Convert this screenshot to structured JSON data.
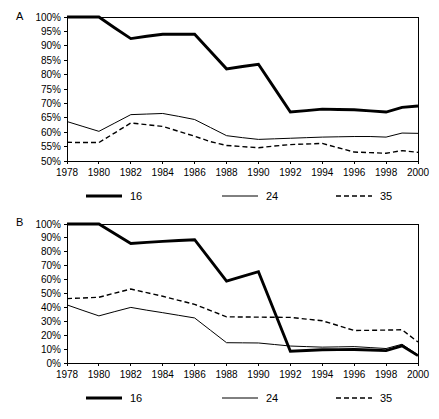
{
  "figure": {
    "background": "#ffffff",
    "line_color": "#000000",
    "panels": [
      {
        "label": "A"
      },
      {
        "label": "B"
      }
    ]
  },
  "chart_data": [
    {
      "type": "line",
      "panel": "A",
      "title": "",
      "xlabel": "",
      "ylabel": "",
      "x": [
        1978,
        1979,
        1980,
        1981,
        1982,
        1983,
        1984,
        1985,
        1986,
        1987,
        1988,
        1989,
        1990,
        1991,
        1992,
        1993,
        1994,
        1995,
        1996,
        1997,
        1998,
        1999,
        2000
      ],
      "xlim": [
        1978,
        2000
      ],
      "ylim": [
        50,
        100
      ],
      "ytick_labels": [
        "100%",
        "95%",
        "90%",
        "85%",
        "80%",
        "75%",
        "70%",
        "65%",
        "60%",
        "55%",
        "50%"
      ],
      "ytick_values": [
        100,
        95,
        90,
        85,
        80,
        75,
        70,
        65,
        60,
        55,
        50
      ],
      "xtick_labels": [
        "1978",
        "1980",
        "1982",
        "1984",
        "1986",
        "1988",
        "1990",
        "1992",
        "1994",
        "1996",
        "1998",
        "2000"
      ],
      "xtick_values": [
        1978,
        1980,
        1982,
        1984,
        1986,
        1988,
        1990,
        1992,
        1994,
        1996,
        1998,
        2000
      ],
      "grid": false,
      "legend_position": "bottom",
      "series": [
        {
          "name": "16",
          "style": "thick-solid",
          "values": [
            100.0,
            100.0,
            100.0,
            96.2,
            92.5,
            93.3,
            94.0,
            94.0,
            94.0,
            88.0,
            82.0,
            82.8,
            83.6,
            75.3,
            67.0,
            67.5,
            68.0,
            67.9,
            67.8,
            67.4,
            67.0,
            68.6,
            69.1
          ]
        },
        {
          "name": "24",
          "style": "thin-solid",
          "values": [
            63.7,
            62.0,
            60.3,
            63.2,
            66.1,
            66.3,
            66.5,
            65.5,
            64.4,
            61.6,
            58.8,
            58.1,
            57.5,
            57.7,
            57.9,
            58.1,
            58.3,
            58.4,
            58.5,
            58.5,
            58.3,
            59.7,
            59.6
          ]
        },
        {
          "name": "35",
          "style": "dashed",
          "values": [
            56.5,
            56.4,
            56.4,
            59.8,
            63.2,
            62.6,
            62.0,
            60.3,
            58.6,
            56.7,
            55.4,
            55.0,
            54.6,
            55.2,
            55.7,
            55.9,
            56.1,
            54.6,
            53.1,
            52.9,
            52.7,
            53.6,
            53.0
          ]
        }
      ],
      "legend": [
        {
          "label": "16",
          "style": "thick-solid"
        },
        {
          "label": "24",
          "style": "thin-solid"
        },
        {
          "label": "35",
          "style": "dashed"
        }
      ]
    },
    {
      "type": "line",
      "panel": "B",
      "title": "",
      "xlabel": "",
      "ylabel": "",
      "x": [
        1978,
        1979,
        1980,
        1981,
        1982,
        1983,
        1984,
        1985,
        1986,
        1987,
        1988,
        1989,
        1990,
        1991,
        1992,
        1993,
        1994,
        1995,
        1996,
        1997,
        1998,
        1999,
        2000
      ],
      "xlim": [
        1978,
        2000
      ],
      "ylim": [
        0,
        100
      ],
      "ytick_labels": [
        "100%",
        "90%",
        "80%",
        "70%",
        "60%",
        "50%",
        "40%",
        "30%",
        "20%",
        "10%",
        "0%"
      ],
      "ytick_values": [
        100,
        90,
        80,
        70,
        60,
        50,
        40,
        30,
        20,
        10,
        0
      ],
      "xtick_labels": [
        "1978",
        "1980",
        "1982",
        "1984",
        "1986",
        "1988",
        "1990",
        "1992",
        "1994",
        "1996",
        "1998",
        "2000"
      ],
      "xtick_values": [
        1978,
        1980,
        1982,
        1984,
        1986,
        1988,
        1990,
        1992,
        1994,
        1996,
        1998,
        2000
      ],
      "grid": false,
      "legend_position": "bottom",
      "series": [
        {
          "name": "16",
          "style": "thick-solid",
          "values": [
            100.0,
            100.0,
            100.0,
            93.0,
            86.0,
            86.8,
            87.5,
            88.1,
            88.7,
            73.8,
            58.9,
            62.3,
            65.7,
            37.0,
            8.5,
            9.0,
            9.5,
            9.6,
            9.7,
            9.3,
            8.9,
            12.4,
            5.3
          ]
        },
        {
          "name": "24",
          "style": "thin-solid",
          "values": [
            41.8,
            37.8,
            33.9,
            37.0,
            40.0,
            38.0,
            36.2,
            34.3,
            32.4,
            23.5,
            14.6,
            14.5,
            14.4,
            13.3,
            12.2,
            11.8,
            11.4,
            11.6,
            11.8,
            11.1,
            10.4,
            13.5,
            5.8
          ]
        },
        {
          "name": "35",
          "style": "dashed",
          "values": [
            46.3,
            46.8,
            47.3,
            50.3,
            53.2,
            50.6,
            48.0,
            45.1,
            42.2,
            37.7,
            33.2,
            33.1,
            33.0,
            32.9,
            32.8,
            31.6,
            30.4,
            26.9,
            23.4,
            23.5,
            23.7,
            23.9,
            15.1
          ]
        }
      ],
      "legend": [
        {
          "label": "16",
          "style": "thick-solid"
        },
        {
          "label": "24",
          "style": "thin-solid"
        },
        {
          "label": "35",
          "style": "dashed"
        }
      ]
    }
  ]
}
